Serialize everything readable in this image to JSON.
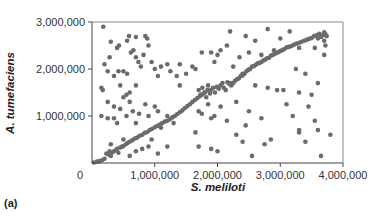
{
  "chart_data": {
    "type": "scatter",
    "title": "",
    "panel_label": "(a)",
    "xlabel": "S. meliloti",
    "ylabel": "A. tumefaciens",
    "xlim": [
      0,
      4000000
    ],
    "ylim": [
      0,
      3000000
    ],
    "x_ticks": [
      0,
      1000000,
      2000000,
      3000000,
      4000000
    ],
    "x_tick_labels": [
      "0",
      "1,000,000",
      "2,000,000",
      "3,000,000",
      "4,000,000"
    ],
    "y_ticks": [
      1000000,
      2000000,
      3000000
    ],
    "y_tick_labels": [
      "1,000,000",
      "2,000,000",
      "3,000,000"
    ],
    "grid": false,
    "legend": null,
    "marker_color": "#6b6b6b",
    "series": [
      {
        "name": "orthologous gene positions",
        "points": [
          [
            30000,
            10000
          ],
          [
            80000,
            30000
          ],
          [
            120000,
            40000
          ],
          [
            160000,
            60000
          ],
          [
            200000,
            90000
          ],
          [
            230000,
            200000
          ],
          [
            260000,
            180000
          ],
          [
            280000,
            250000
          ],
          [
            300000,
            150000
          ],
          [
            330000,
            230000
          ],
          [
            360000,
            260000
          ],
          [
            400000,
            300000
          ],
          [
            420000,
            220000
          ],
          [
            450000,
            330000
          ],
          [
            480000,
            350000
          ],
          [
            500000,
            360000
          ],
          [
            540000,
            400000
          ],
          [
            570000,
            430000
          ],
          [
            600000,
            450000
          ],
          [
            640000,
            480000
          ],
          [
            680000,
            520000
          ],
          [
            720000,
            540000
          ],
          [
            760000,
            580000
          ],
          [
            800000,
            600000
          ],
          [
            840000,
            640000
          ],
          [
            880000,
            660000
          ],
          [
            920000,
            700000
          ],
          [
            960000,
            730000
          ],
          [
            1000000,
            760000
          ],
          [
            1040000,
            790000
          ],
          [
            1080000,
            820000
          ],
          [
            1120000,
            850000
          ],
          [
            1160000,
            880000
          ],
          [
            1200000,
            900000
          ],
          [
            1240000,
            930000
          ],
          [
            1280000,
            970000
          ],
          [
            1320000,
            1000000
          ],
          [
            1360000,
            1040000
          ],
          [
            1400000,
            1080000
          ],
          [
            1440000,
            1120000
          ],
          [
            1480000,
            1170000
          ],
          [
            1520000,
            1210000
          ],
          [
            1560000,
            1250000
          ],
          [
            1600000,
            1300000
          ],
          [
            1640000,
            1340000
          ],
          [
            1680000,
            1380000
          ],
          [
            1720000,
            1420000
          ],
          [
            1760000,
            1460000
          ],
          [
            1800000,
            1500000
          ],
          [
            1840000,
            1550000
          ],
          [
            1700000,
            1550000
          ],
          [
            1730000,
            1450000
          ],
          [
            1760000,
            1600000
          ],
          [
            1790000,
            1500000
          ],
          [
            1820000,
            1400000
          ],
          [
            1850000,
            1650000
          ],
          [
            1880000,
            1480000
          ],
          [
            1900000,
            1560000
          ],
          [
            1930000,
            1600000
          ],
          [
            1960000,
            1500000
          ],
          [
            1990000,
            1620000
          ],
          [
            2020000,
            1580000
          ],
          [
            2050000,
            1650000
          ],
          [
            2080000,
            1700000
          ],
          [
            2100000,
            1600000
          ],
          [
            2130000,
            1550000
          ],
          [
            2160000,
            1720000
          ],
          [
            2190000,
            1680000
          ],
          [
            2220000,
            1650000
          ],
          [
            2250000,
            1700000
          ],
          [
            2280000,
            1750000
          ],
          [
            2310000,
            1780000
          ],
          [
            2340000,
            1800000
          ],
          [
            2370000,
            1850000
          ],
          [
            2400000,
            1860000
          ],
          [
            2430000,
            1900000
          ],
          [
            2460000,
            1950000
          ],
          [
            2490000,
            1980000
          ],
          [
            2520000,
            2000000
          ],
          [
            2550000,
            2050000
          ],
          [
            2580000,
            2060000
          ],
          [
            2610000,
            2090000
          ],
          [
            2640000,
            2120000
          ],
          [
            2670000,
            2130000
          ],
          [
            2700000,
            2150000
          ],
          [
            2730000,
            2180000
          ],
          [
            2760000,
            2200000
          ],
          [
            2790000,
            2230000
          ],
          [
            2820000,
            2240000
          ],
          [
            2850000,
            2280000
          ],
          [
            2880000,
            2300000
          ],
          [
            2910000,
            2320000
          ],
          [
            2940000,
            2340000
          ],
          [
            2970000,
            2360000
          ],
          [
            3000000,
            2380000
          ],
          [
            3030000,
            2400000
          ],
          [
            3060000,
            2420000
          ],
          [
            3100000,
            2460000
          ],
          [
            3140000,
            2470000
          ],
          [
            3180000,
            2490000
          ],
          [
            3220000,
            2520000
          ],
          [
            3260000,
            2540000
          ],
          [
            3300000,
            2560000
          ],
          [
            3340000,
            2580000
          ],
          [
            3380000,
            2600000
          ],
          [
            3420000,
            2620000
          ],
          [
            3460000,
            2640000
          ],
          [
            3500000,
            2660000
          ],
          [
            3540000,
            2700000
          ],
          [
            3580000,
            2720000
          ],
          [
            3600000,
            2650000
          ],
          [
            3620000,
            2750000
          ],
          [
            3650000,
            2680000
          ],
          [
            3680000,
            2720000
          ],
          [
            3700000,
            2780000
          ],
          [
            3720000,
            2740000
          ],
          [
            3740000,
            2700000
          ],
          [
            3700000,
            2600000
          ],
          [
            3720000,
            2500000
          ],
          [
            3700000,
            2300000
          ],
          [
            180000,
            2900000
          ],
          [
            300000,
            2580000
          ],
          [
            400000,
            2450000
          ],
          [
            430000,
            2500000
          ],
          [
            280000,
            2250000
          ],
          [
            200000,
            2100000
          ],
          [
            150000,
            1600000
          ],
          [
            170000,
            1550000
          ],
          [
            250000,
            1950000
          ],
          [
            420000,
            1950000
          ],
          [
            500000,
            1950000
          ],
          [
            560000,
            1900000
          ],
          [
            620000,
            2350000
          ],
          [
            660000,
            2400000
          ],
          [
            700000,
            2250000
          ],
          [
            740000,
            2150000
          ],
          [
            780000,
            2050000
          ],
          [
            820000,
            2300000
          ],
          [
            850000,
            2700000
          ],
          [
            880000,
            2650000
          ],
          [
            950000,
            2150000
          ],
          [
            1000000,
            2000000
          ],
          [
            1050000,
            1850000
          ],
          [
            590000,
            2700000
          ],
          [
            560000,
            2600000
          ],
          [
            700000,
            2680000
          ],
          [
            900000,
            2500000
          ],
          [
            1100000,
            2050000
          ],
          [
            1200000,
            2100000
          ],
          [
            1250000,
            1950000
          ],
          [
            1350000,
            1850000
          ],
          [
            1400000,
            1650000
          ],
          [
            1500000,
            1900000
          ],
          [
            1400000,
            2100000
          ],
          [
            1600000,
            2050000
          ],
          [
            1650000,
            2000000
          ],
          [
            1750000,
            2350000
          ],
          [
            1900000,
            2350000
          ],
          [
            1950000,
            2150000
          ],
          [
            2000000,
            2300000
          ],
          [
            2150000,
            2500000
          ],
          [
            2250000,
            2050000
          ],
          [
            2350000,
            2250000
          ],
          [
            2500000,
            2350000
          ],
          [
            2600000,
            2600000
          ],
          [
            2700000,
            2300000
          ],
          [
            2900000,
            2400000
          ],
          [
            3000000,
            2650000
          ],
          [
            3150000,
            2800000
          ],
          [
            3300000,
            2450000
          ],
          [
            2200000,
            2800000
          ],
          [
            2050000,
            2400000
          ],
          [
            2450000,
            2700000
          ],
          [
            3550000,
            2450000
          ],
          [
            2800000,
            2850000
          ],
          [
            250000,
            1300000
          ],
          [
            350000,
            1200000
          ],
          [
            450000,
            1150000
          ],
          [
            500000,
            1400000
          ],
          [
            600000,
            1300000
          ],
          [
            650000,
            1100000
          ],
          [
            750000,
            1050000
          ],
          [
            850000,
            1250000
          ],
          [
            350000,
            950000
          ],
          [
            550000,
            1000000
          ],
          [
            700000,
            850000
          ],
          [
            900000,
            1000000
          ],
          [
            1050000,
            1100000
          ],
          [
            1200000,
            1000000
          ],
          [
            1300000,
            850000
          ],
          [
            1100000,
            750000
          ],
          [
            1000000,
            1200000
          ],
          [
            150000,
            1000000
          ],
          [
            250000,
            950000
          ],
          [
            400000,
            850000
          ],
          [
            600000,
            1500000
          ],
          [
            450000,
            1650000
          ],
          [
            700000,
            1650000
          ],
          [
            350000,
            1850000
          ],
          [
            550000,
            1450000
          ],
          [
            1700000,
            1100000
          ],
          [
            1750000,
            1050000
          ],
          [
            1850000,
            1250000
          ],
          [
            1900000,
            950000
          ],
          [
            1950000,
            1000000
          ],
          [
            2050000,
            1200000
          ],
          [
            2150000,
            900000
          ],
          [
            2300000,
            1300000
          ],
          [
            2450000,
            800000
          ],
          [
            2500000,
            1100000
          ],
          [
            2700000,
            950000
          ],
          [
            2950000,
            1550000
          ],
          [
            3050000,
            1550000
          ],
          [
            3100000,
            1250000
          ],
          [
            3300000,
            1500000
          ],
          [
            3500000,
            1450000
          ],
          [
            3200000,
            1000000
          ],
          [
            3300000,
            650000
          ],
          [
            3600000,
            700000
          ],
          [
            3550000,
            900000
          ],
          [
            2600000,
            1650000
          ],
          [
            2800000,
            1600000
          ],
          [
            2400000,
            1900000
          ],
          [
            2200000,
            1700000
          ],
          [
            3400000,
            1900000
          ],
          [
            1650000,
            650000
          ],
          [
            1700000,
            350000
          ],
          [
            1900000,
            300000
          ],
          [
            2300000,
            600000
          ],
          [
            2400000,
            450000
          ],
          [
            2550000,
            150000
          ],
          [
            2750000,
            400000
          ],
          [
            2850000,
            500000
          ],
          [
            3300000,
            700000
          ],
          [
            3400000,
            450000
          ],
          [
            3650000,
            150000
          ],
          [
            2000000,
            250000
          ],
          [
            3250000,
            2000000
          ],
          [
            800000,
            300000
          ],
          [
            700000,
            250000
          ],
          [
            600000,
            150000
          ],
          [
            900000,
            350000
          ],
          [
            1050000,
            200000
          ],
          [
            950000,
            500000
          ],
          [
            300000,
            400000
          ],
          [
            500000,
            500000
          ],
          [
            1200000,
            350000
          ],
          [
            3800000,
            600000
          ],
          [
            3450000,
            1200000
          ],
          [
            3600000,
            1700000
          ]
        ]
      }
    ]
  }
}
